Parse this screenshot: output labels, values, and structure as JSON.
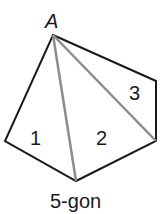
{
  "diagram": {
    "caption": "5-gon",
    "vertex_label": "A",
    "regions": [
      {
        "label": "1"
      },
      {
        "label": "2"
      },
      {
        "label": "3"
      }
    ],
    "colors": {
      "outline": "#1a1a1a",
      "diagonal": "#8c8c8c",
      "text": "#1a1a1a"
    }
  }
}
